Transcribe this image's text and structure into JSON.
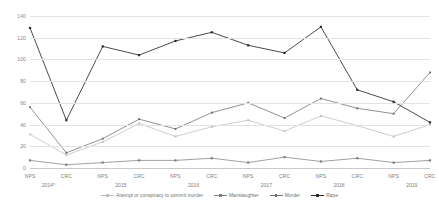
{
  "chart_data": {
    "type": "line",
    "title": "",
    "xlabel": "",
    "ylabel": "",
    "ylim": [
      0,
      140
    ],
    "yticks": [
      0,
      20,
      40,
      60,
      80,
      100,
      120,
      140
    ],
    "grid": true,
    "legend_position": "bottom",
    "x": [
      "NPS",
      "CRC",
      "NPS",
      "CRC",
      "NPS",
      "CRC",
      "NPS",
      "CRC",
      "NPS",
      "CRC",
      "NPS",
      "CRC"
    ],
    "year_groups": [
      {
        "label": "2014*",
        "span": 2
      },
      {
        "label": "2015",
        "span": 2
      },
      {
        "label": "2016",
        "span": 2
      },
      {
        "label": "2017",
        "span": 2
      },
      {
        "label": "2018",
        "span": 2
      },
      {
        "label": "2019",
        "span": 2
      }
    ],
    "series": [
      {
        "name": "Attempt or conspiracy to commit murder",
        "color": "#bdbdbd",
        "values": [
          31,
          12,
          24,
          41,
          29,
          38,
          44,
          34,
          48,
          39,
          29,
          40
        ]
      },
      {
        "name": "Manslaughter",
        "color": "#808080",
        "values": [
          7,
          3,
          5,
          7,
          7,
          9,
          5,
          10,
          6,
          9,
          5,
          7
        ]
      },
      {
        "name": "Murder",
        "color": "#6e6e6e",
        "values": [
          56,
          14,
          27,
          45,
          36,
          51,
          60,
          46,
          64,
          55,
          50,
          88
        ]
      },
      {
        "name": "Rape",
        "color": "#2b2b2b",
        "values": [
          129,
          44,
          112,
          104,
          117,
          125,
          113,
          106,
          130,
          72,
          61,
          42
        ]
      }
    ]
  },
  "legend": {
    "items": [
      {
        "label": "Attempt or conspiracy to commit murder"
      },
      {
        "label": "Manslaughter"
      },
      {
        "label": "Murder"
      },
      {
        "label": "Rape"
      }
    ]
  }
}
